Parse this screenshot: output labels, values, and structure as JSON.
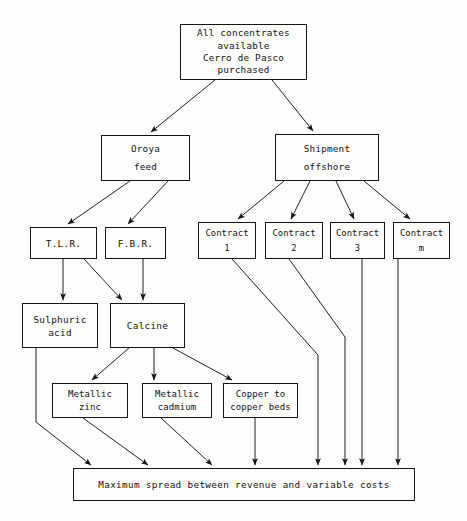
{
  "diagram": {
    "title": "All concentrates available Cerro de Pasco purchased",
    "nodes": {
      "source": {
        "id": "source",
        "lines": [
          "All concentrates",
          "available",
          "Cerro de Pasco",
          "purchased"
        ],
        "x": 180,
        "y": 24,
        "w": 127,
        "h": 56
      },
      "oroya_feed": {
        "id": "oroya_feed",
        "lines": [
          "Oroya",
          "feed"
        ],
        "x": 101,
        "y": 135,
        "w": 89,
        "h": 46
      },
      "shipment_offshore": {
        "id": "shipment_offshore",
        "lines": [
          "Shipment",
          "offshore"
        ],
        "x": 275,
        "y": 134,
        "w": 104,
        "h": 47
      },
      "tlr": {
        "id": "tlr",
        "lines": [
          "T.L.R."
        ],
        "x": 30,
        "y": 227,
        "w": 67,
        "h": 32
      },
      "fbr": {
        "id": "fbr",
        "lines": [
          "F.B.R."
        ],
        "x": 105,
        "y": 227,
        "w": 61,
        "h": 32
      },
      "contract_1": {
        "id": "contract_1",
        "lines": [
          "Contract",
          "1"
        ],
        "x": 198,
        "y": 222,
        "w": 58,
        "h": 37
      },
      "contract_2": {
        "id": "contract_2",
        "lines": [
          "Contract",
          "2"
        ],
        "x": 265,
        "y": 222,
        "w": 58,
        "h": 37
      },
      "contract_3": {
        "id": "contract_3",
        "lines": [
          "Contract",
          "3"
        ],
        "x": 330,
        "y": 222,
        "w": 55,
        "h": 37
      },
      "contract_m": {
        "id": "contract_m",
        "lines": [
          "Contract",
          "m"
        ],
        "x": 393,
        "y": 222,
        "w": 57,
        "h": 37
      },
      "sulphuric_acid": {
        "id": "sulphuric_acid",
        "lines": [
          "Sulphuric",
          "acid"
        ],
        "x": 22,
        "y": 303,
        "w": 76,
        "h": 45
      },
      "calcine": {
        "id": "calcine",
        "lines": [
          "Calcine"
        ],
        "x": 110,
        "y": 303,
        "w": 75,
        "h": 45
      },
      "metallic_zinc": {
        "id": "metallic_zinc",
        "lines": [
          "Metallic",
          "zinc"
        ],
        "x": 52,
        "y": 383,
        "w": 76,
        "h": 35
      },
      "metallic_cadmium": {
        "id": "metallic_cadmium",
        "lines": [
          "Metallic",
          "cadmium"
        ],
        "x": 142,
        "y": 383,
        "w": 70,
        "h": 35
      },
      "copper_beds": {
        "id": "copper_beds",
        "lines": [
          "Copper to",
          "copper beds"
        ],
        "x": 223,
        "y": 383,
        "w": 75,
        "h": 35
      },
      "objective": {
        "id": "objective",
        "lines": [
          "Maximum spread between revenue and variable costs"
        ],
        "x": 73,
        "y": 468,
        "w": 342,
        "h": 33
      }
    },
    "edges": [
      {
        "from": "source",
        "to": "oroya_feed",
        "kind": "diagonal"
      },
      {
        "from": "source",
        "to": "shipment_offshore",
        "kind": "diagonal"
      },
      {
        "from": "oroya_feed",
        "to": "tlr",
        "kind": "diagonal"
      },
      {
        "from": "oroya_feed",
        "to": "fbr",
        "kind": "diagonal"
      },
      {
        "from": "shipment_offshore",
        "to": "contract_1",
        "kind": "diagonal"
      },
      {
        "from": "shipment_offshore",
        "to": "contract_2",
        "kind": "diagonal"
      },
      {
        "from": "shipment_offshore",
        "to": "contract_3",
        "kind": "diagonal"
      },
      {
        "from": "shipment_offshore",
        "to": "contract_m",
        "kind": "diagonal"
      },
      {
        "from": "tlr",
        "to": "sulphuric_acid",
        "kind": "vertical"
      },
      {
        "from": "tlr",
        "to": "calcine",
        "kind": "diagonal"
      },
      {
        "from": "fbr",
        "to": "calcine",
        "kind": "vertical"
      },
      {
        "from": "calcine",
        "to": "metallic_zinc",
        "kind": "diagonal"
      },
      {
        "from": "calcine",
        "to": "metallic_cadmium",
        "kind": "vertical"
      },
      {
        "from": "calcine",
        "to": "copper_beds",
        "kind": "diagonal"
      },
      {
        "from": "sulphuric_acid",
        "to": "objective",
        "kind": "diagonal"
      },
      {
        "from": "metallic_zinc",
        "to": "objective",
        "kind": "diagonal"
      },
      {
        "from": "metallic_cadmium",
        "to": "objective",
        "kind": "diagonal"
      },
      {
        "from": "copper_beds",
        "to": "objective",
        "kind": "vertical"
      },
      {
        "from": "contract_1",
        "to": "objective",
        "kind": "elbow"
      },
      {
        "from": "contract_2",
        "to": "objective",
        "kind": "elbow"
      },
      {
        "from": "contract_3",
        "to": "objective",
        "kind": "vertical"
      },
      {
        "from": "contract_m",
        "to": "objective",
        "kind": "vertical"
      }
    ]
  },
  "style": {
    "line_color": "#151515",
    "box_fill": "#fdfdfb",
    "page_background": "#ffffff",
    "text_color": "#121212"
  }
}
